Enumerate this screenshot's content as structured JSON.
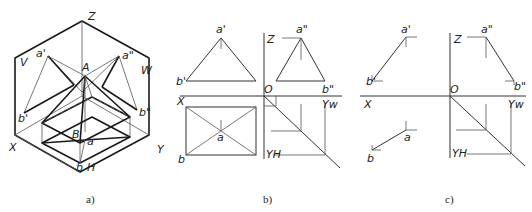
{
  "figures": [
    {
      "id": "a",
      "caption": "a)",
      "description": "Axonometric view of a pyramid projected onto V, H, W planes",
      "labels": {
        "z": "Z",
        "x": "X",
        "y": "Y",
        "v": "V",
        "w": "W",
        "h": "H",
        "a_prime": "a'",
        "a_double": "a\"",
        "A": "A",
        "b_prime": "b'",
        "b_double": "b\"",
        "B": "B",
        "a": "a",
        "b": "b"
      }
    },
    {
      "id": "b",
      "caption": "b)",
      "description": "Three-view orthographic projection of the pyramid",
      "labels": {
        "a_prime": "a'",
        "b_prime": "b'",
        "z": "Z",
        "a_double": "a\"",
        "b_double": "b\"",
        "o": "O",
        "x": "X",
        "yw": "Yw",
        "yh": "YH",
        "a": "a",
        "b": "b"
      }
    },
    {
      "id": "c",
      "caption": "c)",
      "description": "Three-view projection of line segment AB",
      "labels": {
        "a_prime": "a'",
        "b_prime": "b'",
        "z": "Z",
        "a_double": "a\"",
        "b_double": "b\"",
        "o": "O",
        "x": "X",
        "yw": "Yw",
        "yh": "YH",
        "a": "a",
        "b": "b"
      }
    }
  ]
}
